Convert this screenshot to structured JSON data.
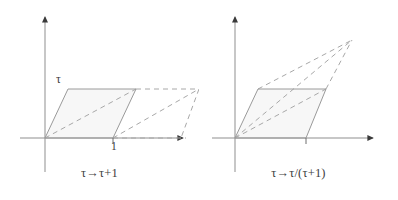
{
  "figure": {
    "background_color": "#ffffff",
    "axis_color": "#8f8f8f",
    "solid_edge_color": "#9a9a9a",
    "dashed_edge_color": "#a8a8a8",
    "fill_color": "#f7f7f7",
    "text_color": "#3d3d3d"
  },
  "panels": [
    {
      "id": "left",
      "caption": "τ→τ+1",
      "y_axis_label": "τ",
      "x_tick_label": "1",
      "origin": {
        "x": 45,
        "y": 138
      },
      "x_axis": {
        "x1": 20,
        "y1": 138,
        "x2": 188,
        "y2": 138,
        "arrow": "right"
      },
      "y_axis": {
        "x1": 45,
        "y1": 172,
        "x2": 45,
        "y2": 12,
        "arrow": "up"
      },
      "solid_parallelogram": {
        "vertices": [
          [
            45,
            138
          ],
          [
            68,
            89
          ],
          [
            136,
            89
          ],
          [
            113,
            138
          ]
        ],
        "filled": true
      },
      "dashed_parallelogram": {
        "vertices": [
          [
            113,
            138
          ],
          [
            136,
            89
          ],
          [
            199,
            89
          ],
          [
            181,
            138
          ]
        ],
        "filled": false
      },
      "dashed_segments": [
        [
          [
            45,
            138
          ],
          [
            136,
            89
          ]
        ],
        [
          [
            113,
            138
          ],
          [
            199,
            89
          ]
        ],
        [
          [
            45,
            138
          ],
          [
            181,
            138
          ]
        ]
      ]
    },
    {
      "id": "right",
      "caption": "τ→τ/(τ+1)",
      "y_axis_label": "τ",
      "x_tick_label": "1",
      "origin": {
        "x": 235,
        "y": 138
      },
      "x_axis": {
        "x1": 212,
        "y1": 138,
        "x2": 378,
        "y2": 138,
        "arrow": "right"
      },
      "y_axis": {
        "x1": 235,
        "y1": 172,
        "x2": 235,
        "y2": 12,
        "arrow": "up"
      },
      "solid_parallelogram": {
        "vertices": [
          [
            235,
            138
          ],
          [
            258,
            89
          ],
          [
            326,
            89
          ],
          [
            306,
            138
          ]
        ],
        "filled": true
      },
      "dashed_triangle": {
        "vertices": [
          [
            258,
            89
          ],
          [
            352,
            40
          ],
          [
            326,
            89
          ]
        ],
        "apex": [
          352,
          40
        ]
      },
      "dashed_segments": [
        [
          [
            235,
            138
          ],
          [
            326,
            89
          ]
        ],
        [
          [
            258,
            89
          ],
          [
            352,
            40
          ]
        ],
        [
          [
            326,
            89
          ],
          [
            352,
            40
          ]
        ],
        [
          [
            235,
            138
          ],
          [
            352,
            40
          ]
        ]
      ]
    }
  ]
}
